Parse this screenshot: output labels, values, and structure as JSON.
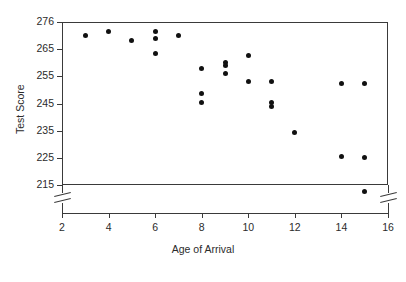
{
  "chart_data": {
    "type": "scatter",
    "title": "",
    "xlabel": "Age of Arrival",
    "ylabel": "Test Score",
    "xlim": [
      2,
      16
    ],
    "ylim": [
      215,
      276
    ],
    "grid": false,
    "legend": "none",
    "axis_breaks": {
      "y_axis_break_below": 215,
      "note": "Both left and right vertical axes show a break symbol below the 215 tick"
    },
    "xticks": [
      2,
      4,
      6,
      8,
      10,
      12,
      14,
      16
    ],
    "yticks": [
      215,
      225,
      235,
      245,
      255,
      265,
      276
    ],
    "xtick_labels": [
      "2",
      "4",
      "6",
      "8",
      "10",
      "12",
      "14",
      "16"
    ],
    "ytick_labels": [
      "215",
      "225",
      "235",
      "245",
      "255",
      "265",
      "276"
    ],
    "marker": "filled-circle",
    "marker_color": "#111111",
    "points": [
      {
        "x": 3,
        "y": 270.5
      },
      {
        "x": 4,
        "y": 272.0
      },
      {
        "x": 5,
        "y": 268.5
      },
      {
        "x": 6,
        "y": 272.0
      },
      {
        "x": 6,
        "y": 269.5
      },
      {
        "x": 6,
        "y": 263.5
      },
      {
        "x": 7,
        "y": 270.5
      },
      {
        "x": 8,
        "y": 258.0
      },
      {
        "x": 8,
        "y": 248.5
      },
      {
        "x": 8,
        "y": 245.5
      },
      {
        "x": 9,
        "y": 260.0
      },
      {
        "x": 9,
        "y": 259.0
      },
      {
        "x": 9,
        "y": 256.0
      },
      {
        "x": 10,
        "y": 262.5
      },
      {
        "x": 10,
        "y": 253.0
      },
      {
        "x": 11,
        "y": 253.0
      },
      {
        "x": 11,
        "y": 245.5
      },
      {
        "x": 11,
        "y": 244.0
      },
      {
        "x": 12,
        "y": 234.5
      },
      {
        "x": 14,
        "y": 252.5
      },
      {
        "x": 15,
        "y": 252.5
      },
      {
        "x": 15,
        "y": 225.0
      },
      {
        "x": 15,
        "y": 212.5
      },
      {
        "x": 14,
        "y": 225.5
      }
    ]
  },
  "axes": {
    "y_label": "Test Score",
    "x_label": "Age of Arrival"
  }
}
